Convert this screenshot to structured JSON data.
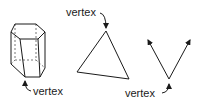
{
  "diagram": {
    "figures": [
      {
        "name": "hexagonal-prism",
        "label": "vertex"
      },
      {
        "name": "triangle",
        "label": "vertex"
      },
      {
        "name": "angle",
        "label": "vertex"
      }
    ]
  },
  "colors": {
    "stroke": "#1a1a1a",
    "background": "#ffffff"
  }
}
